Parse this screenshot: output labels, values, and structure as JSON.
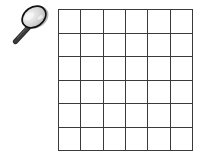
{
  "scene": {
    "title": "Magnifying glass beside an empty grid",
    "background_color": "#ffffff",
    "width": 203,
    "height": 160
  },
  "magnifier": {
    "icon_name": "magnifying-glass-icon",
    "label": "Magnifying glass",
    "lens_fill_color": "#d9d9d9",
    "lens_highlight_color": "#f2f2f2",
    "rim_color": "#1a1a1a",
    "handle_color": "#2b2b2b",
    "rotation_degrees": -35
  },
  "grid": {
    "name": "empty-square-grid",
    "label": "Empty 6 by 6 grid",
    "rows": 6,
    "columns": 6,
    "cell_count": 36,
    "line_color": "#3a3a3a",
    "line_width_px": 1.6,
    "cell_fill_color": "#ffffff",
    "cells": [
      [
        "",
        "",
        "",
        "",
        "",
        ""
      ],
      [
        "",
        "",
        "",
        "",
        "",
        ""
      ],
      [
        "",
        "",
        "",
        "",
        "",
        ""
      ],
      [
        "",
        "",
        "",
        "",
        "",
        ""
      ],
      [
        "",
        "",
        "",
        "",
        "",
        ""
      ],
      [
        "",
        "",
        "",
        "",
        "",
        ""
      ]
    ]
  }
}
